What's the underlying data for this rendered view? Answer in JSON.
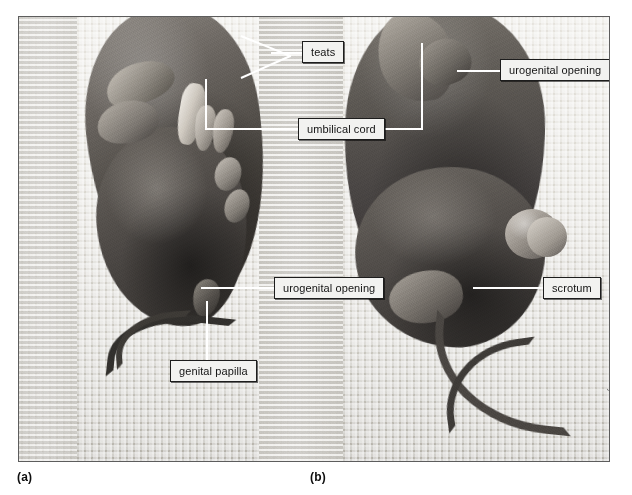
{
  "figure": {
    "kind": "anatomy-photograph-plate",
    "frame_border_color": "#5d5d5d",
    "callout_fill": "#f2f2f0",
    "callout_border": "#1d1d1d",
    "leader_color": "#ffffff"
  },
  "callouts": [
    {
      "id": "teats",
      "label": "teats"
    },
    {
      "id": "urogenital_top",
      "label": "urogenital opening"
    },
    {
      "id": "umbilical_cord",
      "label": "umbilical cord"
    },
    {
      "id": "urogenital_bottom",
      "label": "urogenital opening"
    },
    {
      "id": "scrotum",
      "label": "scrotum"
    },
    {
      "id": "genital_papilla",
      "label": "genital papilla"
    }
  ],
  "sublabels": [
    {
      "id": "a",
      "label": "(a)"
    },
    {
      "id": "b",
      "label": "(b)"
    }
  ],
  "credit": {
    "text": "Photo by D. Morton"
  }
}
